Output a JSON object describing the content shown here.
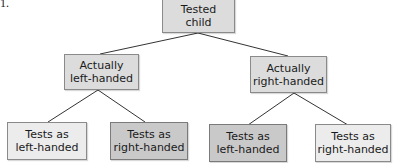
{
  "figure_label": "1.",
  "root": {
    "label": "Tested\nchild",
    "line1": "Tested",
    "line2": "child"
  },
  "level2": [
    {
      "line1": "Actually",
      "line2": "left-handed"
    },
    {
      "line1": "Actually",
      "line2": "right-handed"
    }
  ],
  "level3": [
    {
      "line1": "Tests as",
      "line2": "left-handed",
      "shade": "light"
    },
    {
      "line1": "Tests as",
      "line2": "right-handed",
      "shade": "dark"
    },
    {
      "line1": "Tests as",
      "line2": "left-handed",
      "shade": "dark"
    },
    {
      "line1": "Tests as",
      "line2": "right-handed",
      "shade": "light"
    }
  ]
}
